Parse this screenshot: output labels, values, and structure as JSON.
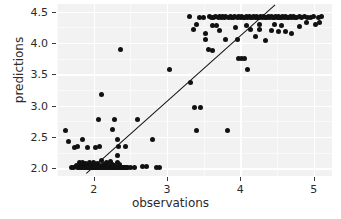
{
  "chart_data": {
    "type": "scatter",
    "title": "",
    "xlabel": "observations",
    "ylabel": "predictions",
    "xlim": [
      1.5,
      5.25
    ],
    "ylim": [
      1.88,
      4.62
    ],
    "xticks": [
      2,
      3,
      4,
      5
    ],
    "xtick_labels": [
      "2",
      "3",
      "4",
      "5"
    ],
    "yticks": [
      2.0,
      2.5,
      3.0,
      3.5,
      4.0,
      4.5
    ],
    "ytick_labels": [
      "2.0",
      "2.5",
      "3.0",
      "3.5",
      "4.0",
      "4.5"
    ],
    "grid": true,
    "legend": "none",
    "point_color": "#111111",
    "panel_color": "#f2f2f2",
    "gridline_color": "#ffffff",
    "line": {
      "name": "identity-fit-line",
      "color": "#111111",
      "x": [
        1.9,
        4.47
      ],
      "y": [
        1.93,
        4.61
      ]
    },
    "points": [
      [
        1.62,
        2.6
      ],
      [
        1.66,
        2.43
      ],
      [
        1.7,
        2.02
      ],
      [
        1.72,
        2.02
      ],
      [
        1.74,
        2.34
      ],
      [
        1.76,
        2.05
      ],
      [
        1.78,
        2.02
      ],
      [
        1.8,
        2.1
      ],
      [
        1.8,
        2.02
      ],
      [
        1.82,
        2.02
      ],
      [
        1.83,
        2.06
      ],
      [
        1.84,
        2.02
      ],
      [
        1.85,
        2.1
      ],
      [
        1.86,
        2.02
      ],
      [
        1.87,
        2.04
      ],
      [
        1.88,
        2.02
      ],
      [
        1.89,
        2.08
      ],
      [
        1.9,
        2.02
      ],
      [
        1.91,
        2.02
      ],
      [
        1.92,
        2.05
      ],
      [
        1.93,
        2.02
      ],
      [
        1.94,
        2.09
      ],
      [
        1.95,
        2.02
      ],
      [
        1.96,
        2.02
      ],
      [
        1.97,
        2.06
      ],
      [
        1.98,
        2.02
      ],
      [
        1.99,
        2.02
      ],
      [
        2.0,
        2.1
      ],
      [
        2.0,
        2.02
      ],
      [
        2.01,
        2.02
      ],
      [
        2.02,
        2.04
      ],
      [
        2.03,
        2.02
      ],
      [
        2.04,
        2.02
      ],
      [
        2.05,
        2.08
      ],
      [
        2.06,
        2.02
      ],
      [
        2.07,
        2.02
      ],
      [
        2.08,
        2.05
      ],
      [
        2.09,
        2.02
      ],
      [
        2.1,
        2.02
      ],
      [
        2.11,
        2.12
      ],
      [
        2.12,
        2.02
      ],
      [
        2.13,
        2.02
      ],
      [
        2.14,
        2.06
      ],
      [
        2.15,
        2.02
      ],
      [
        2.16,
        2.02
      ],
      [
        2.17,
        2.09
      ],
      [
        2.18,
        2.02
      ],
      [
        2.19,
        2.02
      ],
      [
        2.2,
        2.04
      ],
      [
        2.21,
        2.02
      ],
      [
        2.22,
        2.02
      ],
      [
        2.23,
        2.11
      ],
      [
        2.24,
        2.02
      ],
      [
        2.25,
        2.02
      ],
      [
        2.26,
        2.07
      ],
      [
        2.27,
        2.02
      ],
      [
        2.28,
        2.02
      ],
      [
        2.29,
        2.05
      ],
      [
        2.3,
        2.02
      ],
      [
        2.31,
        2.02
      ],
      [
        2.32,
        2.09
      ],
      [
        2.33,
        2.02
      ],
      [
        2.34,
        2.02
      ],
      [
        2.35,
        2.06
      ],
      [
        2.36,
        2.02
      ],
      [
        2.37,
        2.02
      ],
      [
        2.38,
        2.02
      ],
      [
        2.39,
        2.02
      ],
      [
        2.4,
        2.02
      ],
      [
        2.41,
        2.02
      ],
      [
        2.42,
        2.02
      ],
      [
        2.43,
        2.02
      ],
      [
        2.44,
        2.02
      ],
      [
        2.45,
        2.02
      ],
      [
        1.78,
        2.35
      ],
      [
        1.85,
        2.46
      ],
      [
        1.92,
        2.34
      ],
      [
        2.02,
        2.34
      ],
      [
        2.08,
        2.35
      ],
      [
        2.06,
        2.78
      ],
      [
        2.1,
        3.18
      ],
      [
        2.26,
        2.62
      ],
      [
        2.28,
        2.78
      ],
      [
        2.32,
        2.46
      ],
      [
        2.33,
        2.2
      ],
      [
        2.34,
        2.35
      ],
      [
        2.36,
        3.9
      ],
      [
        2.44,
        2.35
      ],
      [
        2.46,
        2.02
      ],
      [
        2.5,
        2.02
      ],
      [
        2.55,
        2.01
      ],
      [
        2.6,
        2.78
      ],
      [
        2.66,
        2.03
      ],
      [
        2.72,
        2.03
      ],
      [
        2.8,
        2.46
      ],
      [
        2.86,
        2.02
      ],
      [
        2.9,
        2.02
      ],
      [
        3.04,
        3.57
      ],
      [
        3.3,
        4.42
      ],
      [
        3.32,
        3.37
      ],
      [
        3.36,
        4.21
      ],
      [
        3.38,
        2.97
      ],
      [
        3.4,
        2.6
      ],
      [
        3.44,
        4.4
      ],
      [
        3.46,
        2.97
      ],
      [
        3.5,
        4.41
      ],
      [
        3.52,
        4.15
      ],
      [
        3.56,
        3.9
      ],
      [
        3.58,
        4.42
      ],
      [
        3.6,
        4.4
      ],
      [
        3.62,
        3.88
      ],
      [
        3.64,
        4.41
      ],
      [
        3.66,
        4.42
      ],
      [
        3.68,
        4.27
      ],
      [
        3.7,
        4.41
      ],
      [
        3.72,
        4.42
      ],
      [
        3.74,
        4.4
      ],
      [
        3.76,
        4.42
      ],
      [
        3.78,
        4.41
      ],
      [
        3.8,
        4.42
      ],
      [
        3.82,
        2.6
      ],
      [
        3.84,
        4.41
      ],
      [
        3.86,
        4.42
      ],
      [
        3.88,
        4.4
      ],
      [
        3.9,
        4.41
      ],
      [
        3.92,
        4.42
      ],
      [
        3.94,
        4.25
      ],
      [
        3.96,
        4.41
      ],
      [
        3.97,
        3.75
      ],
      [
        3.98,
        4.42
      ],
      [
        4.0,
        4.41
      ],
      [
        4.02,
        3.75
      ],
      [
        4.02,
        4.42
      ],
      [
        4.04,
        4.4
      ],
      [
        4.06,
        3.75
      ],
      [
        4.06,
        4.41
      ],
      [
        4.08,
        4.42
      ],
      [
        4.1,
        4.41
      ],
      [
        4.1,
        3.58
      ],
      [
        4.12,
        4.42
      ],
      [
        4.14,
        4.4
      ],
      [
        4.16,
        4.41
      ],
      [
        4.18,
        4.42
      ],
      [
        4.2,
        4.41
      ],
      [
        4.22,
        4.42
      ],
      [
        4.24,
        4.4
      ],
      [
        4.26,
        4.41
      ],
      [
        4.28,
        4.42
      ],
      [
        4.3,
        4.41
      ],
      [
        4.32,
        4.42
      ],
      [
        4.34,
        4.4
      ],
      [
        4.36,
        4.41
      ],
      [
        4.38,
        4.42
      ],
      [
        4.4,
        4.41
      ],
      [
        4.42,
        4.42
      ],
      [
        4.44,
        4.4
      ],
      [
        4.46,
        4.41
      ],
      [
        4.48,
        4.42
      ],
      [
        4.5,
        4.41
      ],
      [
        4.52,
        4.42
      ],
      [
        4.54,
        4.4
      ],
      [
        4.56,
        4.41
      ],
      [
        4.58,
        4.42
      ],
      [
        4.6,
        4.41
      ],
      [
        4.62,
        4.42
      ],
      [
        4.64,
        4.4
      ],
      [
        4.66,
        4.41
      ],
      [
        4.68,
        4.42
      ],
      [
        4.7,
        4.41
      ],
      [
        4.72,
        4.42
      ],
      [
        4.74,
        4.4
      ],
      [
        4.76,
        4.41
      ],
      [
        4.8,
        4.42
      ],
      [
        4.84,
        4.41
      ],
      [
        4.88,
        4.42
      ],
      [
        4.92,
        4.4
      ],
      [
        4.96,
        4.41
      ],
      [
        5.0,
        4.42
      ],
      [
        5.06,
        4.41
      ],
      [
        5.1,
        4.42
      ],
      [
        3.52,
        4.05
      ],
      [
        3.72,
        4.2
      ],
      [
        3.8,
        4.05
      ],
      [
        3.96,
        4.06
      ],
      [
        4.14,
        4.22
      ],
      [
        4.2,
        4.1
      ],
      [
        4.26,
        4.22
      ],
      [
        4.34,
        4.04
      ],
      [
        4.42,
        4.2
      ],
      [
        4.52,
        4.18
      ],
      [
        4.62,
        4.18
      ],
      [
        4.7,
        4.15
      ],
      [
        4.8,
        4.26
      ],
      [
        5.02,
        4.3
      ],
      [
        4.46,
        4.3
      ],
      [
        4.56,
        4.28
      ],
      [
        3.62,
        4.28
      ],
      [
        3.4,
        4.3
      ],
      [
        4.08,
        4.28
      ],
      [
        4.26,
        4.3
      ],
      [
        4.9,
        4.33
      ],
      [
        5.08,
        4.33
      ]
    ]
  }
}
